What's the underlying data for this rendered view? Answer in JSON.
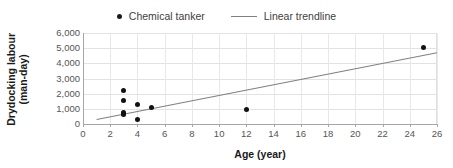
{
  "legend": {
    "position": "top-center",
    "entries": [
      {
        "label": "Chemical tanker",
        "marker": "dot-marker-icon",
        "color": "#111111"
      },
      {
        "label": "Linear trendline",
        "marker": "line-marker-icon",
        "color": "#808080"
      }
    ]
  },
  "axes": {
    "x": {
      "title": "Age (year)",
      "min": 0,
      "max": 26,
      "step": 2,
      "ticks": [
        "0",
        "2",
        "4",
        "6",
        "8",
        "10",
        "12",
        "14",
        "16",
        "18",
        "20",
        "22",
        "24",
        "26"
      ]
    },
    "y": {
      "title": "Drydocking labour\n(man-day)",
      "title_line1": "Drydocking labour",
      "title_line2": "(man-day)",
      "min": 0,
      "max": 6000,
      "step": 1000,
      "ticks": [
        "0",
        "1,000",
        "2,000",
        "3,000",
        "4,000",
        "5,000",
        "6,000"
      ]
    }
  },
  "chart_data": {
    "type": "scatter",
    "title": "",
    "xlabel": "Age (year)",
    "ylabel": "Drydocking labour (man-day)",
    "xlim": [
      0,
      26
    ],
    "ylim": [
      0,
      6000
    ],
    "xticks": [
      0,
      2,
      4,
      6,
      8,
      10,
      12,
      14,
      16,
      18,
      20,
      22,
      24,
      26
    ],
    "yticks": [
      0,
      1000,
      2000,
      3000,
      4000,
      5000,
      6000
    ],
    "grid": true,
    "legend_position": "top-center",
    "series": [
      {
        "name": "Chemical tanker",
        "type": "scatter",
        "color": "#111111",
        "points": [
          {
            "x": 3,
            "y": 2200
          },
          {
            "x": 3,
            "y": 1550
          },
          {
            "x": 3,
            "y": 780
          },
          {
            "x": 3,
            "y": 700
          },
          {
            "x": 3,
            "y": 640
          },
          {
            "x": 4,
            "y": 1300
          },
          {
            "x": 4,
            "y": 320
          },
          {
            "x": 5,
            "y": 1100
          },
          {
            "x": 12,
            "y": 950
          },
          {
            "x": 25,
            "y": 5050
          }
        ]
      },
      {
        "name": "Linear trendline",
        "type": "line",
        "color": "#808080",
        "endpoints": [
          {
            "x": 1,
            "y": 300
          },
          {
            "x": 26,
            "y": 4700
          }
        ]
      }
    ]
  }
}
